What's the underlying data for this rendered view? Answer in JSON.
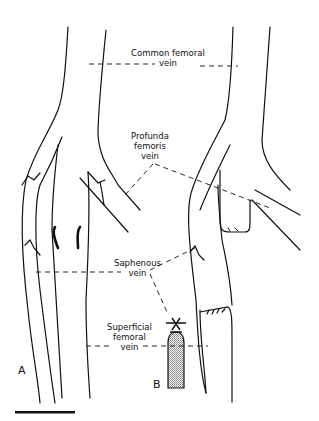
{
  "figure": {
    "panels": [
      {
        "id": "A",
        "label": "A"
      },
      {
        "id": "B",
        "label": "B"
      }
    ],
    "labels": {
      "common_femoral": [
        "Common femoral",
        "vein"
      ],
      "profunda": [
        "Profunda",
        "femoris",
        "vein"
      ],
      "saphenous": [
        "Saphenous",
        "vein"
      ],
      "superficial": [
        "Superficial",
        "femoral",
        "vein"
      ]
    },
    "scale_bar": "scale-bar",
    "colors": {
      "line": "#111111",
      "background": "#ffffff",
      "stipple": "#9a9a9a"
    }
  }
}
